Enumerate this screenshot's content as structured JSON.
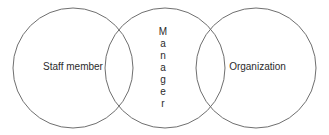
{
  "diagram": {
    "type": "venn-three-circle",
    "canvas": {
      "width": 329,
      "height": 135,
      "background": "#ffffff"
    },
    "stroke_color": "#6f6f6f",
    "text_color": "#2b2b2b",
    "circles": [
      {
        "id": "staff-member",
        "label": "Staff member",
        "cx": 73,
        "cy": 68,
        "r": 60
      },
      {
        "id": "manager",
        "label": "Manager",
        "cx": 165,
        "cy": 68,
        "r": 60
      },
      {
        "id": "organization",
        "label": "Organization",
        "cx": 256,
        "cy": 68,
        "r": 60
      }
    ],
    "labels": {
      "left": "Staff member",
      "right": "Organization",
      "center": "Manager",
      "center_letters": [
        "M",
        "a",
        "n",
        "a",
        "g",
        "e",
        "r"
      ]
    }
  }
}
